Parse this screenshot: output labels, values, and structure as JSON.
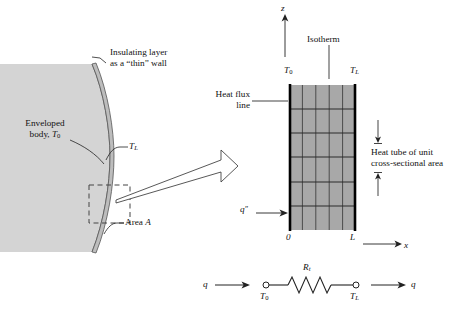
{
  "figure": {
    "type": "heat-transfer-schematic"
  },
  "left_panel": {
    "name": "enveloped-body-cross-section",
    "body_fill": "#d4d4d4",
    "insulation_fill": "#bdbdbd",
    "labels": {
      "insulating_layer_line1": "Insulating layer",
      "insulating_layer_line2": "as a “thin” wall",
      "enveloped_body_line1": "Enveloped",
      "enveloped_body_line2_prefix": "body, ",
      "enveloped_body_temp": "T",
      "enveloped_body_temp_sub": "0",
      "surface_temp": "T",
      "surface_temp_sub": "L",
      "area_prefix": "Area ",
      "area_symbol": "A"
    },
    "detail_box": {
      "name": "detail-callout-box",
      "style": "dashed"
    }
  },
  "zoom_arrow": {
    "name": "magnify-arrow",
    "direction": "right",
    "style": "tapered-outline"
  },
  "right_panel": {
    "name": "flux-plot-wall",
    "wall_fill": "#a8a8a8",
    "wall_edge_color": "#000000",
    "grid": {
      "isotherm_count": 4,
      "flux_line_count": 5,
      "isotherm_label": "Isotherm",
      "flux_line_label_line1": "Heat flux",
      "flux_line_label_line2": "line"
    },
    "temperatures": {
      "left": "T",
      "left_sub": "0",
      "right": "T",
      "right_sub": "L"
    },
    "axes": {
      "vertical_label": "z",
      "horizontal_label": "x",
      "origin_label": "0",
      "thickness_label": "L"
    },
    "flux_arrow_label": "q",
    "flux_arrow_primes": "″",
    "heat_tube_line1": "Heat tube of unit",
    "heat_tube_line2": "cross-sectional area"
  },
  "circuit": {
    "name": "thermal-resistance-network",
    "inlet_label": "q",
    "outlet_label": "q",
    "node_left": "T",
    "node_left_sub": "0",
    "node_right": "T",
    "node_right_sub": "L",
    "resistance": "R",
    "resistance_sub": "t"
  }
}
